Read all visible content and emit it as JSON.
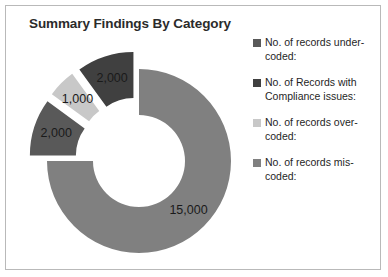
{
  "chart_data": {
    "type": "pie",
    "variant": "exploded-doughnut",
    "title": "Summary Findings By Category",
    "xlabel": "",
    "ylabel": "",
    "legend_position": "right",
    "grid": false,
    "hole_ratio": 0.5,
    "categories": [
      "No. of records under-coded:",
      "No. of Records with Compliance issues:",
      "No. of records over-coded:",
      "No. of records mis-coded:"
    ],
    "values": [
      2000,
      2000,
      1000,
      15000
    ],
    "value_labels": [
      "2,000",
      "2,000",
      "1,000",
      "15,000"
    ],
    "colors": [
      "#595959",
      "#404040",
      "#c8c8c8",
      "#808080"
    ],
    "slices": [
      {
        "label": "No. of records mis-coded:",
        "value": 15000,
        "value_label": "15,000",
        "color": "#808080",
        "start_angle": 0,
        "end_angle": 270,
        "exploded": false
      },
      {
        "label": "No. of records under-coded:",
        "value": 2000,
        "value_label": "2,000",
        "color": "#595959",
        "start_angle": 270,
        "end_angle": 306,
        "exploded": true
      },
      {
        "label": "No. of records over-coded:",
        "value": 1000,
        "value_label": "1,000",
        "color": "#c8c8c8",
        "start_angle": 306,
        "end_angle": 324,
        "exploded": true
      },
      {
        "label": "No. of Records with Compliance issues:",
        "value": 2000,
        "value_label": "2,000",
        "color": "#404040",
        "start_angle": 324,
        "end_angle": 360,
        "exploded": true
      }
    ]
  },
  "legend": {
    "items": [
      {
        "label": "No. of records under-coded:",
        "color": "#595959"
      },
      {
        "label": "No. of Records with Compliance issues:",
        "color": "#404040"
      },
      {
        "label": "No. of records over-coded:",
        "color": "#c8c8c8"
      },
      {
        "label": "No. of records mis-coded:",
        "color": "#808080"
      }
    ]
  },
  "frame": {
    "border_color": "#b9b9b9",
    "background": "#ffffff"
  }
}
